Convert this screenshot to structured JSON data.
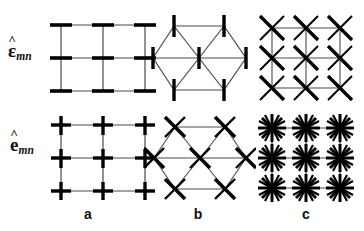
{
  "figure": {
    "type": "lattice-diagram-grid",
    "background_color": "#ffffff",
    "stroke_color": "#000000",
    "thin_line_color": "#4a4a4a",
    "rows": [
      {
        "id": "row-eps",
        "label_symbol": "ε",
        "label_hat": "^",
        "label_subscript": "mn",
        "label_text": "ε̂mn"
      },
      {
        "id": "row-e",
        "label_symbol": "e",
        "label_hat": "^",
        "label_subscript": "mn",
        "label_text": "ên"
      }
    ],
    "columns": [
      {
        "id": "col-a",
        "caption": "a",
        "lattice": "square"
      },
      {
        "id": "col-b",
        "caption": "b",
        "lattice": "hexagonal"
      },
      {
        "id": "col-c",
        "caption": "c",
        "lattice": "square-with-diagonals"
      }
    ],
    "panels": [
      {
        "id": "panel-a-top",
        "row": "row-eps",
        "column": "col-a",
        "lattice": "square",
        "marker": "horizontal-bar",
        "node_count": 9,
        "grid_cells": "2x2"
      },
      {
        "id": "panel-b-top",
        "row": "row-eps",
        "column": "col-b",
        "lattice": "hexagonal",
        "marker": "vertical-bar",
        "node_count": 7
      },
      {
        "id": "panel-c-top",
        "row": "row-eps",
        "column": "col-c",
        "lattice": "square-with-diagonals",
        "marker": "diagonal-cross",
        "node_count": 9,
        "grid_cells": "2x2"
      },
      {
        "id": "panel-a-bottom",
        "row": "row-e",
        "column": "col-a",
        "lattice": "square",
        "marker": "plus-cross",
        "node_count": 9,
        "grid_cells": "2x2"
      },
      {
        "id": "panel-b-bottom",
        "row": "row-e",
        "column": "col-b",
        "lattice": "hexagonal",
        "marker": "diagonal-cross",
        "node_count": 7
      },
      {
        "id": "panel-c-bottom",
        "row": "row-e",
        "column": "col-c",
        "lattice": "square-with-diagonals",
        "marker": "twelve-ray-star",
        "node_count": 9,
        "grid_cells": "2x2"
      }
    ],
    "captions": {
      "a": "a",
      "b": "b",
      "c": "c"
    }
  }
}
